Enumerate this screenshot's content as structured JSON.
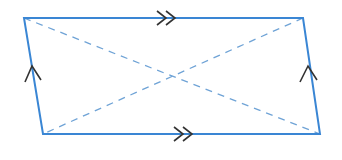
{
  "diagram": {
    "type": "parallelogram",
    "colors": {
      "edge": "#3a86d4",
      "diagonal": "#6fa3d6",
      "marker": "#333333",
      "background": "#ffffff"
    },
    "vertices": {
      "top_left": [
        24,
        18
      ],
      "top_right": [
        303,
        18
      ],
      "bottom_right": [
        320,
        134
      ],
      "bottom_left": [
        43,
        134
      ]
    },
    "markers": {
      "top_edge": "double-arrow",
      "bottom_edge": "double-arrow",
      "left_edge": "single-arrow",
      "right_edge": "single-arrow"
    }
  }
}
